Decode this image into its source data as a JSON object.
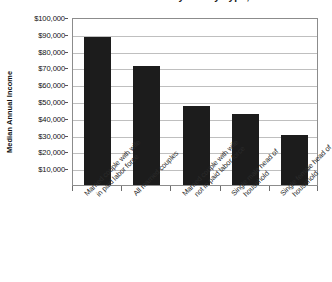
{
  "chart_data": {
    "type": "bar",
    "title": "Median Annual Income by Family Type, 2008",
    "xlabel": "",
    "ylabel": "Median Annual Income",
    "ylim": [
      0,
      100000
    ],
    "ytick_step": 10000,
    "grid": true,
    "legend": "none",
    "bar_color": "#1c1c1c",
    "categories": [
      "Married couple with wife in paid labor force",
      "All married couples",
      "Married couple with wife not in paid labor force",
      "Single male head of household",
      "Single female head of household"
    ],
    "category_lines": [
      [
        "Married couple with wife",
        "in paid labor force"
      ],
      [
        "All married couples",
        ""
      ],
      [
        "Married couple with wife",
        "not in paid labor force"
      ],
      [
        "Single male head of",
        "household"
      ],
      [
        "Single female head of",
        "household"
      ]
    ],
    "values": [
      88000,
      71000,
      47000,
      42000,
      30000
    ],
    "ytick_labels": [
      "$100,000",
      "$90,000",
      "$80,000",
      "$70,000",
      "$60,000",
      "$50,000",
      "$40,000",
      "$30,000",
      "$20,000",
      "$10,000"
    ],
    "ytick_values": [
      100000,
      90000,
      80000,
      70000,
      60000,
      50000,
      40000,
      30000,
      20000,
      10000
    ]
  }
}
